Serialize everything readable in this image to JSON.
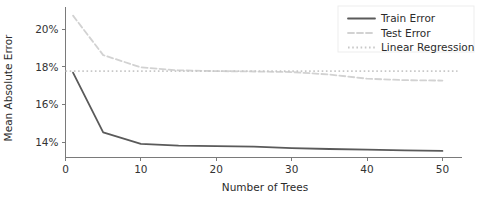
{
  "chart_data": {
    "type": "line",
    "title": "",
    "xlabel": "Number of Trees",
    "ylabel": "Mean Absolute Error",
    "xlim": [
      0,
      52
    ],
    "ylim": [
      13.2,
      21.1
    ],
    "grid": false,
    "legend_position": "upper right",
    "xticks": [
      0,
      10,
      20,
      30,
      40,
      50
    ],
    "xtick_labels": [
      "0",
      "10",
      "20",
      "30",
      "40",
      "50"
    ],
    "yticks": [
      14,
      16,
      18,
      20
    ],
    "ytick_labels": [
      "14%",
      "16%",
      "18%",
      "20%"
    ],
    "series": [
      {
        "name": "Train Error",
        "style": "solid",
        "color": "#5a5a5a",
        "x": [
          1,
          5,
          10,
          15,
          20,
          25,
          30,
          35,
          40,
          45,
          50
        ],
        "values": [
          17.7,
          14.53,
          13.92,
          13.83,
          13.8,
          13.78,
          13.7,
          13.65,
          13.62,
          13.58,
          13.55
        ]
      },
      {
        "name": "Test Error",
        "style": "dashed",
        "color": "#d2d2d2",
        "x": [
          1,
          5,
          10,
          15,
          20,
          25,
          30,
          35,
          40,
          45,
          50
        ],
        "values": [
          20.72,
          18.63,
          17.98,
          17.82,
          17.78,
          17.76,
          17.73,
          17.6,
          17.38,
          17.3,
          17.28
        ]
      },
      {
        "name": "Linear Regression",
        "style": "dotted",
        "color": "#c8c8c8",
        "x": [
          0,
          52
        ],
        "values": [
          17.78,
          17.78
        ]
      }
    ]
  },
  "legend": {
    "entries": [
      {
        "label": "Train Error"
      },
      {
        "label": "Test Error"
      },
      {
        "label": "Linear Regression"
      }
    ]
  },
  "axes": {
    "x_title": "Number of Trees",
    "y_title": "Mean Absolute Error"
  },
  "colors": {
    "train": "#5a5a5a",
    "test": "#d2d2d2",
    "linear_regression": "#c8c8c8",
    "axis": "#7a7a7a",
    "text": "#2b2b2b",
    "background": "#ffffff"
  }
}
